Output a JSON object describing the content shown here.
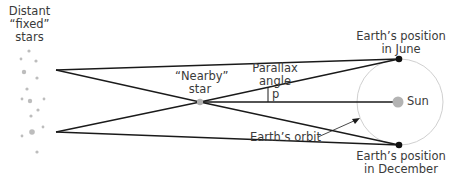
{
  "diagram": {
    "labels": {
      "distant_stars_l1": "Distant",
      "distant_stars_l2": "“fixed”",
      "distant_stars_l3": "stars",
      "nearby_star_l1": "“Nearby”",
      "nearby_star_l2": "star",
      "parallax_l1": "Parallax",
      "parallax_l2": "angle",
      "p": "p",
      "june_l1": "Earth’s position",
      "june_l2": "in June",
      "december_l1": "Earth’s position",
      "december_l2": "in December",
      "sun": "Sun",
      "orbit": "Earth’s orbit"
    },
    "colors": {
      "line": "#1a1a1a",
      "orbit": "#d0d0d0",
      "sun": "#b3b3b3",
      "nearby_star": "#b0b0b0",
      "distant_star": "#bdbdbd",
      "earth": "#111111",
      "text": "#3a3a3a"
    }
  }
}
